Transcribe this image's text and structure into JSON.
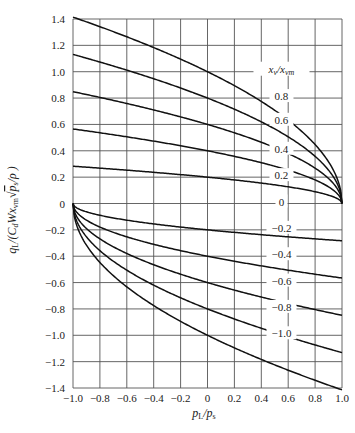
{
  "chart_data": {
    "type": "line",
    "title": "",
    "xlabel": "p_L/p_s",
    "ylabel": "q_L/(C_d W x_vm √(p_s/ρ))",
    "xlim": [
      -1.0,
      1.0
    ],
    "ylim": [
      -1.4,
      1.4
    ],
    "grid": true,
    "legend_title": "x_v/x_vm",
    "x_ticks": [
      "−1.0",
      "−0.8",
      "−0.6",
      "−0.4",
      "−0.2",
      "0",
      "0.2",
      "0.4",
      "0.6",
      "0.8",
      "1.0"
    ],
    "y_ticks": [
      "1.4",
      "1.2",
      "1.0",
      "0.8",
      "0.6",
      "0.4",
      "0.2",
      "0",
      "−0.2",
      "−0.4",
      "−0.6",
      "−0.8",
      "−1.0",
      "−1.2",
      "−1.4"
    ],
    "x": [
      -1.0,
      -0.8,
      -0.6,
      -0.4,
      -0.2,
      0.0,
      0.2,
      0.4,
      0.6,
      0.8,
      1.0
    ],
    "series": [
      {
        "name": "1.0",
        "values": [
          1.41,
          1.34,
          1.26,
          1.18,
          1.1,
          1.0,
          0.89,
          0.77,
          0.63,
          0.45,
          0.0
        ]
      },
      {
        "name": "0.8",
        "values": [
          1.13,
          1.07,
          1.01,
          0.95,
          0.88,
          0.8,
          0.72,
          0.62,
          0.51,
          0.36,
          0.0
        ]
      },
      {
        "name": "0.6",
        "values": [
          0.85,
          0.8,
          0.76,
          0.71,
          0.66,
          0.6,
          0.54,
          0.46,
          0.38,
          0.27,
          0.0
        ]
      },
      {
        "name": "0.4",
        "values": [
          0.57,
          0.54,
          0.51,
          0.47,
          0.44,
          0.4,
          0.36,
          0.31,
          0.25,
          0.18,
          0.0
        ]
      },
      {
        "name": "0.2",
        "values": [
          0.28,
          0.27,
          0.25,
          0.24,
          0.22,
          0.2,
          0.18,
          0.15,
          0.13,
          0.09,
          0.0
        ]
      },
      {
        "name": "0",
        "values": [
          0,
          0,
          0,
          0,
          0,
          0,
          0,
          0,
          0,
          0,
          0
        ]
      },
      {
        "name": "−0.2",
        "values": [
          0.0,
          -0.09,
          -0.13,
          -0.15,
          -0.18,
          -0.2,
          -0.22,
          -0.24,
          -0.25,
          -0.27,
          -0.28
        ]
      },
      {
        "name": "−0.4",
        "values": [
          0.0,
          -0.18,
          -0.25,
          -0.31,
          -0.36,
          -0.4,
          -0.44,
          -0.47,
          -0.51,
          -0.54,
          -0.57
        ]
      },
      {
        "name": "−0.6",
        "values": [
          0.0,
          -0.27,
          -0.38,
          -0.46,
          -0.54,
          -0.6,
          -0.66,
          -0.71,
          -0.76,
          -0.8,
          -0.85
        ]
      },
      {
        "name": "−0.8",
        "values": [
          0.0,
          -0.36,
          -0.51,
          -0.62,
          -0.72,
          -0.8,
          -0.88,
          -0.95,
          -1.01,
          -1.07,
          -1.13
        ]
      },
      {
        "name": "−1.0",
        "values": [
          0.0,
          -0.45,
          -0.63,
          -0.77,
          -0.89,
          -1.0,
          -1.1,
          -1.18,
          -1.26,
          -1.34,
          -1.41
        ]
      }
    ],
    "annotations": [
      {
        "text": "x_v/x_vm",
        "x": 0.55,
        "y": 1.0
      },
      {
        "text": "0.8",
        "x": 0.55,
        "y": 0.8
      },
      {
        "text": "0.6",
        "x": 0.55,
        "y": 0.62
      },
      {
        "text": "0.4",
        "x": 0.55,
        "y": 0.4
      },
      {
        "text": "0.2",
        "x": 0.55,
        "y": 0.2
      },
      {
        "text": "0",
        "x": 0.55,
        "y": 0.0
      },
      {
        "text": "−0.2",
        "x": 0.55,
        "y": -0.2
      },
      {
        "text": "−0.4",
        "x": 0.55,
        "y": -0.4
      },
      {
        "text": "−0.6",
        "x": 0.55,
        "y": -0.6
      },
      {
        "text": "−0.8",
        "x": 0.55,
        "y": -0.8
      },
      {
        "text": "−1.0",
        "x": 0.55,
        "y": -1.0
      }
    ]
  },
  "labels": {
    "xlabel_main": "p",
    "xlabel_sub1": "L",
    "xlabel_sub2": "s",
    "legend_title_main": "x",
    "legend_title_sub1": "v",
    "legend_title_sub2": "vm"
  }
}
